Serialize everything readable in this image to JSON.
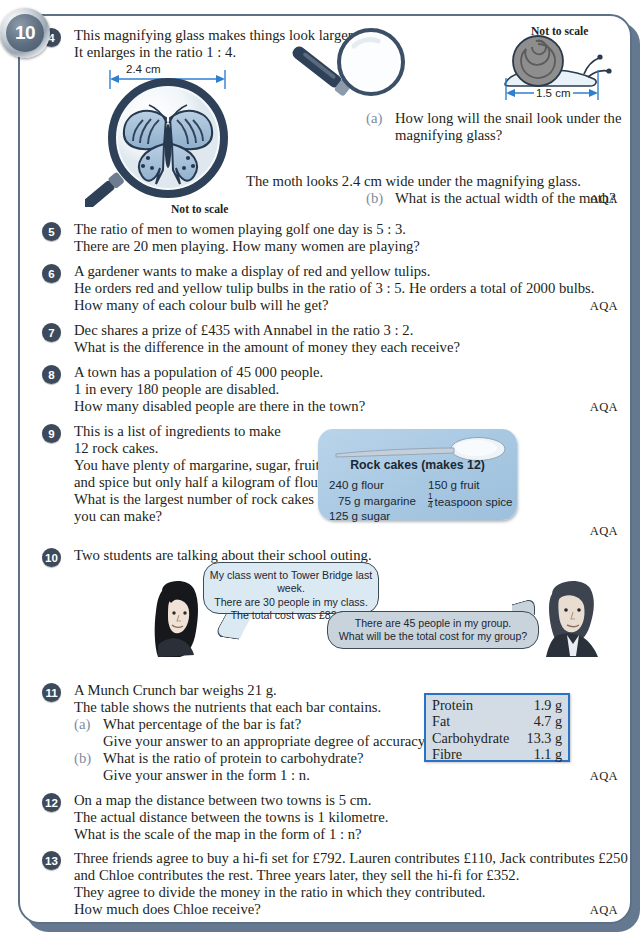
{
  "page": {
    "number": "10"
  },
  "colors": {
    "panel_border": "#5d7186",
    "panel_shadow": "#64798f",
    "question_badge": "#3c4a5c",
    "sub_label": "#7d8da0",
    "recipe_card": "#a8c8e2",
    "nutrition_border": "#2a72c4",
    "nutrition_fill": "#d3dce5",
    "bubble_a": "#dbe9f2",
    "bubble_b": "#c9d3dc",
    "arrow_blue": "#2f7fd0",
    "text": "#231f20"
  },
  "questions": [
    {
      "number": "4",
      "lines": [
        "This magnifying glass makes things look larger.",
        "It enlarges in the ratio 1 : 4."
      ],
      "parts": [
        {
          "label": "(a)",
          "lines": [
            "How long will the snail look under the",
            "magnifying glass?"
          ]
        },
        {
          "label": "(b)",
          "lines": [
            "What is the actual width of the moth?"
          ]
        }
      ],
      "moth_line": "The moth looks 2.4 cm wide under the magnifying glass.",
      "figures": {
        "butterfly_dim": "2.4 cm",
        "butterfly_note": "Not to scale",
        "snail_dim": "1.5 cm",
        "snail_note": "Not to scale"
      },
      "exam": "AQA"
    },
    {
      "number": "5",
      "lines": [
        "The ratio of men to women playing golf one day is 5 : 3.",
        "There are 20 men playing. How many women are playing?"
      ],
      "exam": ""
    },
    {
      "number": "6",
      "lines": [
        "A gardener wants to make a display of red and yellow tulips.",
        "He orders red and yellow tulip bulbs in the ratio of 3 : 5. He orders a total of 2000 bulbs.",
        "How many of each colour bulb will he get?"
      ],
      "exam": "AQA"
    },
    {
      "number": "7",
      "lines": [
        "Dec shares a prize of £435 with Annabel in the ratio 3 : 2.",
        "What is the difference in the amount of money they each receive?"
      ],
      "exam": ""
    },
    {
      "number": "8",
      "lines": [
        "A town has a population of 45 000 people.",
        "1 in every 180 people are disabled.",
        "How many disabled people are there in the town?"
      ],
      "exam": "AQA"
    },
    {
      "number": "9",
      "lines": [
        "This is a list of ingredients to make",
        "12 rock cakes.",
        "You have plenty of margarine, sugar, fruit",
        "and spice but only half a kilogram of flour.",
        "What is the largest number of rock cakes",
        "you can make?"
      ],
      "recipe": {
        "title": "Rock cakes (makes 12)",
        "left": [
          "240 g flour",
          "75 g margarine",
          "125 g sugar"
        ],
        "right_first": "150 g fruit",
        "right_fraction_num": "1",
        "right_fraction_den": "4",
        "right_second": "teaspoon spice"
      },
      "exam": "AQA"
    },
    {
      "number": "10",
      "lines": [
        "Two students are talking about their school outing."
      ],
      "bubble_girl": [
        "My class went to Tower Bridge last week.",
        "There are 30 people in my class.",
        "The total cost was £82.50"
      ],
      "bubble_boy": [
        "There are 45 people in my group.",
        "What will be the total cost for my group?"
      ],
      "exam": ""
    },
    {
      "number": "11",
      "lines": [
        "A Munch Crunch bar weighs 21 g.",
        "The table shows the nutrients that each bar contains."
      ],
      "parts": [
        {
          "label": "(a)",
          "lines": [
            "What percentage of the bar is fat?",
            "Give your answer to an appropriate degree of accuracy."
          ]
        },
        {
          "label": "(b)",
          "lines": [
            "What is the ratio of protein to carbohydrate?",
            "Give your answer in the form 1 : n."
          ]
        }
      ],
      "nutrition": [
        {
          "name": "Protein",
          "value": "1.9 g"
        },
        {
          "name": "Fat",
          "value": "4.7 g"
        },
        {
          "name": "Carbohydrate",
          "value": "13.3 g"
        },
        {
          "name": "Fibre",
          "value": "1.1 g"
        }
      ],
      "exam": "AQA"
    },
    {
      "number": "12",
      "lines": [
        "On a map the distance between two towns is 5 cm.",
        "The actual distance between the towns is 1 kilometre.",
        "What is the scale of the map in the form of 1 : n?"
      ],
      "exam": ""
    },
    {
      "number": "13",
      "lines": [
        "Three friends agree to buy a hi-fi set for £792. Lauren contributes £110, Jack contributes £250",
        "and Chloe contributes the rest. Three years later, they sell the hi-fi for £352.",
        "They agree to divide the money in the ratio in which they contributed.",
        "How much does Chloe receive?"
      ],
      "exam": "AQA"
    }
  ]
}
